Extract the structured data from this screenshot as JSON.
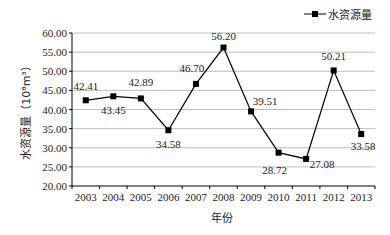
{
  "chart_data": {
    "type": "line",
    "title": "",
    "xlabel": "年份",
    "ylabel": "水资源量（10⁸m³）",
    "x": [
      "2003",
      "2004",
      "2005",
      "2006",
      "2007",
      "2008",
      "2009",
      "2010",
      "2011",
      "2012",
      "2013"
    ],
    "series": [
      {
        "name": "水资源量",
        "values": [
          42.41,
          43.45,
          42.89,
          34.58,
          46.7,
          56.2,
          39.51,
          28.72,
          27.08,
          50.21,
          33.58
        ],
        "labels": [
          "42.41",
          "43.45",
          "42.89",
          "34.58",
          "46.70",
          "56.20",
          "39.51",
          "28.72",
          "27.08",
          "50.21",
          "33.58"
        ],
        "marker": "square",
        "color": "#000000"
      }
    ],
    "yticks": [
      "20.00",
      "25.00",
      "30.00",
      "35.00",
      "40.00",
      "45.00",
      "50.00",
      "55.00",
      "60.00"
    ],
    "ylim": [
      20,
      60
    ],
    "grid": true,
    "legend_position": "top-right"
  },
  "legend": {
    "label": "水资源量"
  },
  "axis": {
    "xlabel": "年份",
    "ylabel": "水资源量（10⁸m³）"
  }
}
